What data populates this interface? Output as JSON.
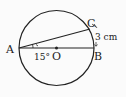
{
  "diagram": {
    "type": "circle-geometry",
    "points": {
      "A": {
        "label": "A"
      },
      "B": {
        "label": "B"
      },
      "C": {
        "label": "C"
      },
      "O": {
        "label": "O"
      }
    },
    "angle_label": "15°",
    "length_label": "3 cm",
    "colors": {
      "stroke": "#222222",
      "background": "#fbfbfb"
    }
  }
}
